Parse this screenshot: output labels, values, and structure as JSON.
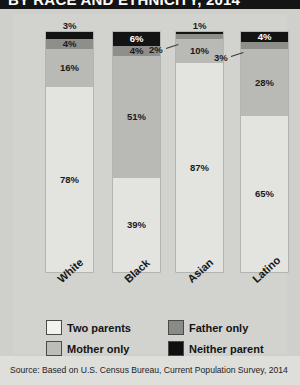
{
  "title": {
    "text": "BY RACE AND ETHNICITY, 2014",
    "clipped": true
  },
  "chart_data": {
    "type": "bar",
    "subtype": "100% stacked column",
    "title": "BY RACE AND ETHNICITY, 2014",
    "xlabel": "",
    "ylabel": "",
    "ylim": [
      0,
      100
    ],
    "grid": false,
    "legend_position": "bottom",
    "categories": [
      "White",
      "Black",
      "Asian",
      "Latino"
    ],
    "series": [
      {
        "name": "Two parents",
        "color": "#e3e3df",
        "values": [
          78,
          39,
          87,
          65
        ]
      },
      {
        "name": "Mother only",
        "color": "#b9b9b5",
        "values": [
          16,
          51,
          10,
          28
        ]
      },
      {
        "name": "Father only",
        "color": "#8e8e8a",
        "values": [
          4,
          4,
          2,
          3
        ]
      },
      {
        "name": "Neither parent",
        "color": "#131313",
        "values": [
          3,
          6,
          1,
          4
        ]
      }
    ],
    "value_labels": {
      "White": {
        "two_parents": "78%",
        "mother_only": "16%",
        "father_only": "4%",
        "neither_parent": "3%"
      },
      "Black": {
        "two_parents": "39%",
        "mother_only": "51%",
        "father_only": "4%",
        "neither_parent": "6%"
      },
      "Asian": {
        "two_parents": "87%",
        "mother_only": "10%",
        "father_only": "2%",
        "neither_parent": "1%"
      },
      "Latino": {
        "two_parents": "65%",
        "mother_only": "28%",
        "father_only": "3%",
        "neither_parent": "4%"
      }
    },
    "annotations": [
      {
        "text": "3%",
        "placement": "above-bar",
        "category": "White",
        "refers_to": "Neither parent"
      },
      {
        "text": "1%",
        "placement": "above-bar",
        "category": "Asian",
        "refers_to": "Neither parent"
      },
      {
        "text": "2%",
        "placement": "callout-left",
        "category": "Asian",
        "refers_to": "Father only"
      },
      {
        "text": "3%",
        "placement": "callout-left",
        "category": "Latino",
        "refers_to": "Father only"
      }
    ]
  },
  "bars": [
    {
      "category": "White",
      "above_label": "3%",
      "segments": [
        {
          "key": "neither",
          "label": "3%",
          "value": 3,
          "show_inside": false
        },
        {
          "key": "father",
          "label": "4%",
          "value": 4,
          "show_inside": true
        },
        {
          "key": "mother",
          "label": "16%",
          "value": 16,
          "show_inside": true
        },
        {
          "key": "two",
          "label": "78%",
          "value": 78,
          "show_inside": true
        }
      ]
    },
    {
      "category": "Black",
      "above_label": "",
      "segments": [
        {
          "key": "neither",
          "label": "6%",
          "value": 6,
          "show_inside": true
        },
        {
          "key": "father",
          "label": "4%",
          "value": 4,
          "show_inside": true
        },
        {
          "key": "mother",
          "label": "51%",
          "value": 51,
          "show_inside": true
        },
        {
          "key": "two",
          "label": "39%",
          "value": 39,
          "show_inside": true
        }
      ]
    },
    {
      "category": "Asian",
      "above_label": "1%",
      "segments": [
        {
          "key": "neither",
          "label": "1%",
          "value": 1,
          "show_inside": false
        },
        {
          "key": "father",
          "label": "2%",
          "value": 2,
          "show_inside": false
        },
        {
          "key": "mother",
          "label": "10%",
          "value": 10,
          "show_inside": true
        },
        {
          "key": "two",
          "label": "87%",
          "value": 87,
          "show_inside": true
        }
      ]
    },
    {
      "category": "Latino",
      "above_label": "",
      "segments": [
        {
          "key": "neither",
          "label": "4%",
          "value": 4,
          "show_inside": true
        },
        {
          "key": "father",
          "label": "3%",
          "value": 3,
          "show_inside": false
        },
        {
          "key": "mother",
          "label": "28%",
          "value": 28,
          "show_inside": true
        },
        {
          "key": "two",
          "label": "65%",
          "value": 65,
          "show_inside": true
        }
      ]
    }
  ],
  "callouts": [
    {
      "text": "2%",
      "target_category": "Asian"
    },
    {
      "text": "3%",
      "target_category": "Latino"
    }
  ],
  "legend": {
    "items": [
      {
        "label": "Two parents",
        "swatch": "two"
      },
      {
        "label": "Father only",
        "swatch": "father"
      },
      {
        "label": "Mother only",
        "swatch": "mother"
      },
      {
        "label": "Neither parent",
        "swatch": "neither"
      }
    ]
  },
  "source": {
    "text": "Source: Based on U.S. Census Bureau, Current Population Survey, 2014"
  },
  "colors": {
    "two_parents": "#e3e3df",
    "mother_only": "#b9b9b5",
    "father_only": "#8e8e8a",
    "neither_parent": "#131313",
    "page_background": "#cfcfcb",
    "title_bar": "#141414"
  }
}
